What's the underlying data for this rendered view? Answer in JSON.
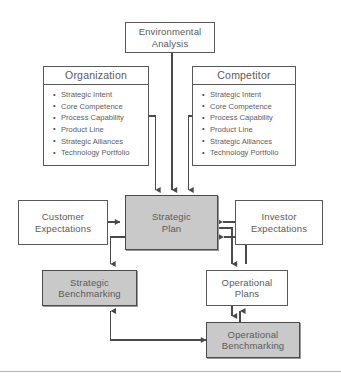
{
  "diagram": {
    "colors": {
      "shaded_fill": "#c9c9c9",
      "plain_fill": "#ffffff",
      "border": "#595959",
      "text": "#5a5a5a",
      "connector": "#4a4a4a",
      "rule": "#b4b4b4"
    },
    "nodes": {
      "environmental_analysis": {
        "label": "Environmental\nAnalysis",
        "shaded": false
      },
      "organization": {
        "header": "Organization",
        "items": [
          "Strategic Intent",
          "Core Competence",
          "Process Capability",
          "Product Line",
          "Strategic Alliances",
          "Technology Portfolio"
        ],
        "shaded": false
      },
      "competitor": {
        "header": "Competitor",
        "items": [
          "Strategic Intent",
          "Core Competence",
          "Process Capability",
          "Product Line",
          "Strategic Alliances",
          "Technology Portfolio"
        ],
        "shaded": false
      },
      "customer_expectations": {
        "label": "Customer\nExpectations",
        "shaded": false
      },
      "investor_expectations": {
        "label": "Investor\nExpectations",
        "shaded": false
      },
      "strategic_plan": {
        "label": "Strategic\nPlan",
        "shaded": true
      },
      "strategic_benchmarking": {
        "label": "Strategic\nBenchmarking",
        "shaded": true
      },
      "operational_plans": {
        "label": "Operational\nPlans",
        "shaded": false
      },
      "operational_benchmarking": {
        "label": "Operational\nBenchmarking",
        "shaded": true
      }
    },
    "connections": [
      {
        "from": "environmental_analysis",
        "to": "strategic_plan",
        "style": "arrow-down"
      },
      {
        "from": "organization",
        "to": "strategic_plan",
        "style": "arrow-down"
      },
      {
        "from": "competitor",
        "to": "strategic_plan",
        "style": "arrow-down"
      },
      {
        "from": "customer_expectations",
        "to": "strategic_plan",
        "style": "arrow-right"
      },
      {
        "from": "investor_expectations",
        "to": "strategic_plan",
        "style": "arrow-left"
      },
      {
        "from": "strategic_plan",
        "to": "strategic_benchmarking",
        "style": "arrow-down"
      },
      {
        "from": "strategic_benchmarking",
        "to": "strategic_plan",
        "style": "arrow-up"
      },
      {
        "from": "strategic_plan",
        "to": "operational_plans",
        "style": "arrow-down"
      },
      {
        "from": "operational_plans",
        "to": "strategic_plan",
        "style": "arrow-up"
      },
      {
        "from": "operational_plans",
        "to": "operational_benchmarking",
        "style": "arrow-down"
      },
      {
        "from": "operational_benchmarking",
        "to": "operational_plans",
        "style": "arrow-up"
      },
      {
        "from": "operational_benchmarking",
        "to": "strategic_benchmarking",
        "style": "arrow-up"
      }
    ]
  }
}
